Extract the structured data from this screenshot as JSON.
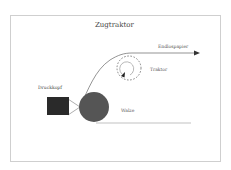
{
  "diagram": {
    "title": "Zugtraktor",
    "labels": {
      "paper": "Endlospapier",
      "tractor": "Traktor",
      "printhead": "Druckkopf",
      "platen": "Walze"
    },
    "colors": {
      "frame": "#cfcfcf",
      "printhead": "#2a2a2a",
      "platen": "#555555",
      "line": "#555555"
    }
  }
}
